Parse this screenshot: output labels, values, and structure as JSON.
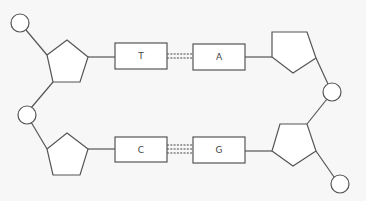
{
  "diagram": {
    "colors": {
      "background": "#f7f7f7",
      "stroke": "#555555",
      "fill": "#ffffff",
      "text": "#444444"
    },
    "top_pair": {
      "left_base": "T",
      "right_base": "A",
      "bond_count": 2
    },
    "bottom_pair": {
      "left_base": "C",
      "right_base": "G",
      "bond_count": 3
    },
    "components": {
      "phosphate_shape": "circle",
      "sugar_shape": "pentagon",
      "base_shape": "rectangle",
      "hydrogen_bond_style": "dashed lines"
    }
  }
}
